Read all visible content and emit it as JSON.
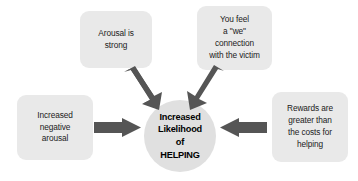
{
  "diagram": {
    "title": "Increased Likelihood of Helping",
    "colors": {
      "box_fill": "#e9e9e9",
      "circle_fill": "#e0e0e0",
      "arrow_fill": "#555555",
      "text": "#1b1b1b",
      "background": "#ffffff"
    },
    "nodes": {
      "arousal_strong": {
        "label": "Arousal is\nstrong",
        "shape": "rounded-rectangle",
        "position": "top-left"
      },
      "we_connection": {
        "label": "You feel\na \"we\"\nconnection\nwith the victim",
        "shape": "rounded-rectangle",
        "position": "top-right"
      },
      "negative_arousal": {
        "label": "Increased\nnegative\narousal",
        "shape": "rounded-rectangle",
        "position": "left"
      },
      "rewards_costs": {
        "label": "Rewards are\ngreater than\nthe costs for\nhelping",
        "shape": "rounded-rectangle",
        "position": "right"
      },
      "outcome": {
        "label": "Increased\nLikelihood\nof\nHELPING",
        "shape": "circle",
        "position": "center"
      }
    },
    "arrows": [
      {
        "name": "arrow-from-arousal-strong",
        "from": "arousal_strong",
        "to": "outcome",
        "direction": "down-right"
      },
      {
        "name": "arrow-from-we-connection",
        "from": "we_connection",
        "to": "outcome",
        "direction": "down-left"
      },
      {
        "name": "arrow-from-negative-arousal",
        "from": "negative_arousal",
        "to": "outcome",
        "direction": "right"
      },
      {
        "name": "arrow-from-rewards-costs",
        "from": "rewards_costs",
        "to": "outcome",
        "direction": "left"
      }
    ]
  }
}
